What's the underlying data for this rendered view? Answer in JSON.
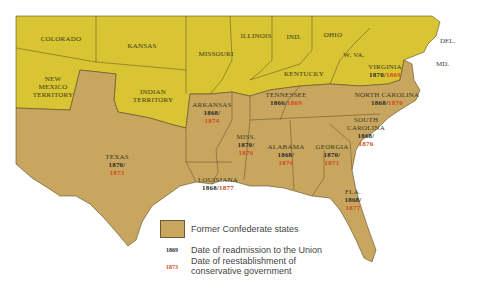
{
  "map": {
    "colors": {
      "confederate": "#c9a660",
      "union": "#d9c434",
      "water": "#ffffff",
      "border": "#5a4a20",
      "readmission_date": "#2a2a2a",
      "conservative_date": "#d2491c"
    },
    "union_states": [
      {
        "name": "COLORADO"
      },
      {
        "name": "KANSAS"
      },
      {
        "name": "MISSOURI"
      },
      {
        "name": "ILLINOIS"
      },
      {
        "name": "IND."
      },
      {
        "name": "OHIO"
      },
      {
        "name": "W. VA."
      },
      {
        "name": "KENTUCKY"
      },
      {
        "name_lines": [
          "NEW",
          "MEXICO",
          "TERRITORY"
        ]
      },
      {
        "name_lines": [
          "INDIAN",
          "TERRITORY"
        ]
      }
    ],
    "external_labels": {
      "del": "DEL.",
      "md": "MD."
    },
    "confederate_states": [
      {
        "name": "TEXAS",
        "readmitted": "1870/",
        "conservative": "1873"
      },
      {
        "name": "ARKANSAS",
        "readmitted": "1868/",
        "conservative": "1874"
      },
      {
        "name": "LOUISIANA",
        "readmitted": "1868/",
        "conservative": "1877"
      },
      {
        "name": "MISS.",
        "readmitted": "1870/",
        "conservative": "1876"
      },
      {
        "name": "ALABAMA",
        "readmitted": "1868/",
        "conservative": "1874"
      },
      {
        "name": "GEORGIA",
        "readmitted": "1870/",
        "conservative": "1871"
      },
      {
        "name": "TENNESSEE",
        "readmitted": "1866/",
        "conservative": "1869"
      },
      {
        "name": "VIRGINIA",
        "readmitted": "1870/",
        "conservative": "1869"
      },
      {
        "name": "NORTH CAROLINA",
        "readmitted": "1868/",
        "conservative": "1870"
      },
      {
        "name_lines": [
          "SOUTH",
          "CAROLINA"
        ],
        "readmitted": "1868/",
        "conservative": "1876"
      },
      {
        "name": "FLA.",
        "readmitted": "1868/",
        "conservative": "1877"
      }
    ]
  },
  "legend": {
    "swatch_label": "Former Confederate states",
    "readmission_sample": "1869",
    "readmission_label": "Date of readmission to the Union",
    "conservative_sample": "1873",
    "conservative_label_line1": "Date of reestablishment of",
    "conservative_label_line2": "conservative government"
  }
}
